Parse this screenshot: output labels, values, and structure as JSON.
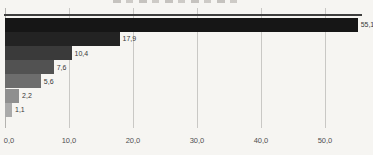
{
  "chart_data": {
    "type": "bar",
    "orientation": "horizontal",
    "title": "",
    "title_cropped": true,
    "values": [
      55.1,
      17.9,
      10.4,
      7.6,
      5.6,
      2.2,
      1.1
    ],
    "value_labels": [
      "55,1",
      "17,9",
      "10,4",
      "7,6",
      "5,6",
      "2,2",
      "1,1"
    ],
    "bar_colors": [
      "#161616",
      "#232323",
      "#3a3a3a",
      "#525252",
      "#6d6d6d",
      "#8f8f8f",
      "#aaaaaa"
    ],
    "x_ticks": [
      0,
      10,
      20,
      30,
      40,
      50
    ],
    "x_tick_labels": [
      "0,0",
      "10,0",
      "20,0",
      "30,0",
      "40,0",
      "50,0"
    ],
    "xlim": [
      0,
      57.5
    ],
    "grid": true,
    "legend": false,
    "background_color": "#f6f5f2",
    "gridline_color": "#c9c8c5",
    "axis_line_color": "#3e3e3e",
    "label_color": "#383838"
  }
}
